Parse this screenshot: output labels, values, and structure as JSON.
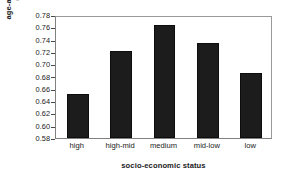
{
  "chart_data": {
    "type": "bar",
    "title": "",
    "subtitle": "",
    "categories": [
      "high",
      "high-mid",
      "medium",
      "mid-low",
      "low"
    ],
    "values": [
      0.651,
      0.721,
      0.763,
      0.735,
      0.686
    ],
    "series": [
      {
        "name": "age-adjusted incidence (per 100,000)",
        "values": [
          0.651,
          0.721,
          0.763,
          0.735,
          0.686
        ]
      }
    ],
    "xlabel": "socio-economic status",
    "ylabel": "age-adjusted incidence",
    "ylabel_line1": "age-adjusted incidence",
    "ylabel_line2": "(per 100,000)",
    "ylim": [
      0.58,
      0.78
    ],
    "ytick_step": 0.02,
    "ytick_labels": [
      "0.78",
      "0.76",
      "0.74",
      "0.72",
      "0.70",
      "0.68",
      "0.66",
      "0.64",
      "0.62",
      "0.60",
      "0.58"
    ],
    "ytick_values": [
      0.78,
      0.76,
      0.74,
      0.72,
      0.7,
      0.68,
      0.66,
      0.64,
      0.62,
      0.6,
      0.58
    ],
    "grid": false,
    "legend": false,
    "legend_position": "none",
    "bar_color": "#1c1c1c",
    "bar_edge_color": "#0d0d0d",
    "axis_color": "#808080",
    "background_color": "#ffffff",
    "annotations": []
  }
}
